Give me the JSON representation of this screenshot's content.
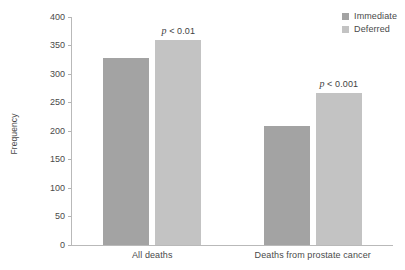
{
  "chart_data": {
    "type": "bar",
    "title": "",
    "subtitle": "",
    "xlabel": "",
    "ylabel": "Frequency",
    "categories": [
      "All deaths",
      "Deaths from prostate cancer"
    ],
    "series": [
      {
        "name": "Immediate",
        "color": "#a3a3a3",
        "values": [
          328,
          209
        ]
      },
      {
        "name": "Deferred",
        "color": "#c3c3c3",
        "values": [
          360,
          266
        ]
      }
    ],
    "ylim": [
      0,
      400
    ],
    "yticks": [
      0,
      50,
      100,
      150,
      200,
      250,
      300,
      350,
      400
    ],
    "ytick_labels": [
      "0",
      "50",
      "100",
      "150",
      "200",
      "250",
      "300",
      "350",
      "400"
    ],
    "grid": false,
    "legend_position": "top-right",
    "annotations": [
      {
        "text_prefix": "p",
        "text_rest": " < 0.01",
        "category": "All deaths",
        "series": "Deferred"
      },
      {
        "text_prefix": "p",
        "text_rest": " < 0.001",
        "category": "Deaths from prostate cancer",
        "series": "Deferred"
      }
    ]
  },
  "axis": {
    "y_title": "Frequency",
    "ticks": [
      "400",
      "350",
      "300",
      "250",
      "200",
      "150",
      "100",
      "50",
      "0"
    ],
    "categories": [
      "All deaths",
      "Deaths from prostate cancer"
    ]
  },
  "legend": {
    "items": [
      {
        "label": "Immediate",
        "color": "#a3a3a3"
      },
      {
        "label": "Deferred",
        "color": "#c3c3c3"
      }
    ]
  },
  "annotations": {
    "p1_italic": "p",
    "p1_rest": " < 0.01",
    "p2_italic": "p",
    "p2_rest": " < 0.001"
  }
}
